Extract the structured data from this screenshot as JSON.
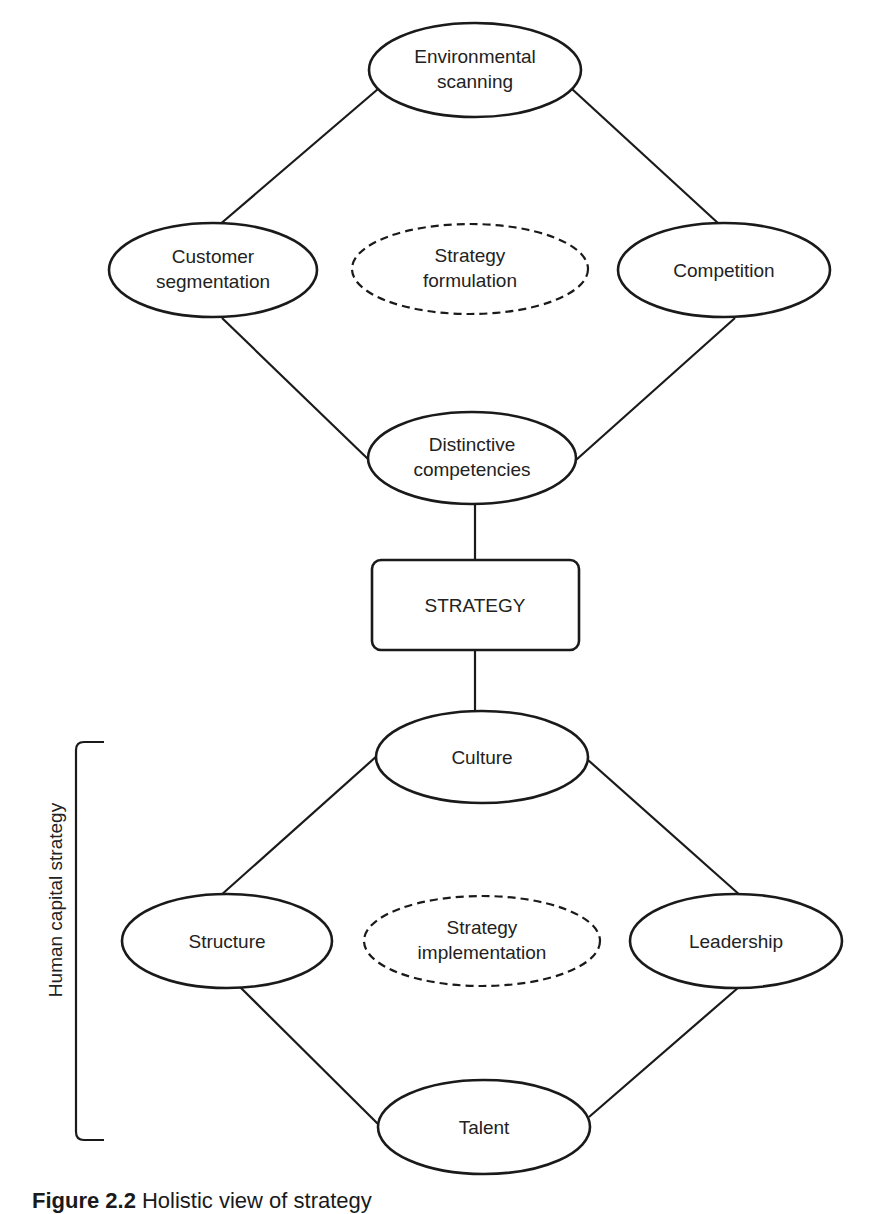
{
  "diagram": {
    "formulation": {
      "center_label": [
        "Strategy",
        "formulation"
      ],
      "top": [
        "Environmental",
        "scanning"
      ],
      "left": [
        "Customer",
        "segmentation"
      ],
      "right": [
        "Competition"
      ],
      "bottom": [
        "Distinctive",
        "competencies"
      ]
    },
    "strategy_box": "STRATEGY",
    "implementation": {
      "center_label": [
        "Strategy",
        "implementation"
      ],
      "top": [
        "Culture"
      ],
      "left": [
        "Structure"
      ],
      "right": [
        "Leadership"
      ],
      "bottom": [
        "Talent"
      ]
    },
    "bracket_label": "Human capital strategy"
  },
  "caption": {
    "number": "Figure 2.2",
    "text": "Holistic view of strategy"
  }
}
